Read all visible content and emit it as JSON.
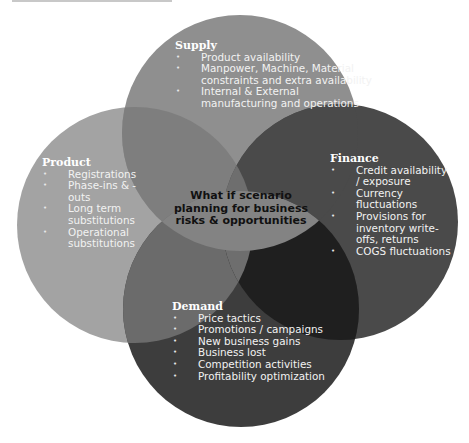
{
  "diagram": {
    "type": "venn-4-circle",
    "center_label": "What if scenario planning for business risks & opportunities",
    "colors": {
      "supply": "#8f8f8f",
      "product": "#a3a3a3",
      "finance": "#4a4a4a",
      "demand": "#3d3d3d",
      "center": "#838383",
      "finance_demand_overlap": "#1f1f1f",
      "text_light": "#f2f2f2",
      "text_center": "#111111"
    },
    "supply": {
      "title": "Supply",
      "items": [
        "Product availability",
        "Manpower, Machine, Material constraints and extra availability",
        "Internal & External manufacturing and operations"
      ]
    },
    "product": {
      "title": "Product",
      "items": [
        "Registrations",
        "Phase-ins & - outs",
        "Long term substitutions",
        "Operational substitutions"
      ]
    },
    "finance": {
      "title": "Finance",
      "items": [
        "Credit availability / exposure",
        "Currency fluctuations",
        "Provisions for inventory write-offs, returns",
        "COGS fluctuations"
      ]
    },
    "demand": {
      "title": "Demand",
      "items": [
        "Price tactics",
        "Promotions / campaigns",
        "New business gains",
        "Business lost",
        "Competition activities",
        "Profitability optimization"
      ]
    }
  }
}
